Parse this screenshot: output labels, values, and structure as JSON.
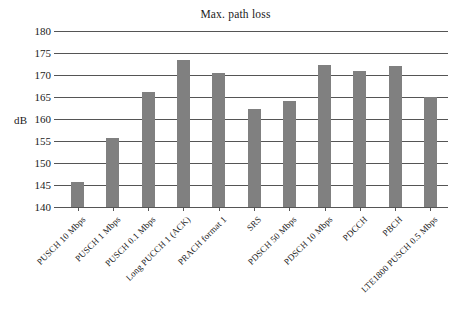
{
  "chart_data": {
    "type": "bar",
    "title": "Max. path loss",
    "xlabel": "",
    "ylabel": "dB",
    "ylim": [
      140,
      180
    ],
    "yticks": [
      140,
      145,
      150,
      155,
      160,
      165,
      170,
      175,
      180
    ],
    "grid": true,
    "legend": null,
    "bar_color": "#808080",
    "categories": [
      "PUSCH 10 Mbps",
      "PUSCH 1 Mbps",
      "PUSCH 0.1 Mbps",
      "Long PUCCH 1 (ACK)",
      "PRACH format 1",
      "SRS",
      "PDSCH 50 Mbps",
      "PDSCH 10 Mbps",
      "PDCCH",
      "PBCH",
      "LTE1800 PUSCH 0.5 Mbps"
    ],
    "values": [
      145.7,
      155.7,
      166.2,
      173.3,
      170.5,
      162.3,
      164.0,
      172.2,
      171.0,
      172.0,
      165.0
    ]
  }
}
